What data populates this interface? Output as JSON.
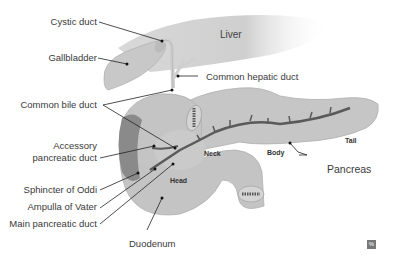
{
  "structures": {
    "liver": "Liver",
    "neck": "Neck",
    "body": "Body",
    "tail": "Tail",
    "head": "Head"
  },
  "labels": {
    "cystic_duct": "Cystic duct",
    "gallbladder": "Gallbladder",
    "common_hepatic_duct": "Common hepatic duct",
    "common_bile_duct": "Common bile duct",
    "accessory_pancreatic_duct_1": "Accessory",
    "accessory_pancreatic_duct_2": "pancreatic duct",
    "sphincter_of_oddi": "Sphincter of Oddi",
    "ampulla_of_vater": "Ampulla of Vater",
    "main_pancreatic_duct": "Main pancreatic duct",
    "duodenum": "Duodenum",
    "pancreas": "Pancreas"
  },
  "badge": "%",
  "colors": {
    "organ_fill": "#c4c4c4",
    "organ_light": "#d6d6d6",
    "duct_dark": "#5a5a5a",
    "leader_line": "#222222",
    "text": "#3a3a3a"
  }
}
